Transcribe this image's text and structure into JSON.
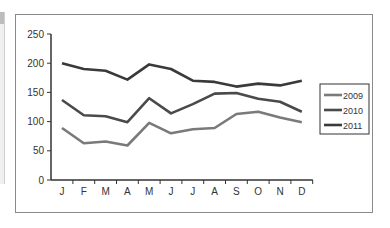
{
  "chart_data": {
    "type": "line",
    "title": "",
    "xlabel": "",
    "ylabel": "",
    "categories": [
      "J",
      "F",
      "M",
      "A",
      "M",
      "J",
      "J",
      "A",
      "S",
      "O",
      "N",
      "D"
    ],
    "yticks": [
      "0",
      "50",
      "100",
      "150",
      "200",
      "250"
    ],
    "ylim": [
      0,
      250
    ],
    "grid": false,
    "legend_position": "right",
    "series": [
      {
        "name": "2009",
        "color": "#7a7a7a",
        "values": [
          89,
          63,
          66,
          59,
          98,
          80,
          87,
          89,
          113,
          117,
          107,
          99
        ]
      },
      {
        "name": "2010",
        "color": "#4a4a4a",
        "values": [
          137,
          111,
          109,
          99,
          140,
          114,
          130,
          148,
          149,
          139,
          134,
          117
        ]
      },
      {
        "name": "2011",
        "color": "#3a3a3a",
        "values": [
          200,
          190,
          187,
          172,
          198,
          190,
          170,
          168,
          160,
          165,
          162,
          170
        ]
      }
    ]
  }
}
